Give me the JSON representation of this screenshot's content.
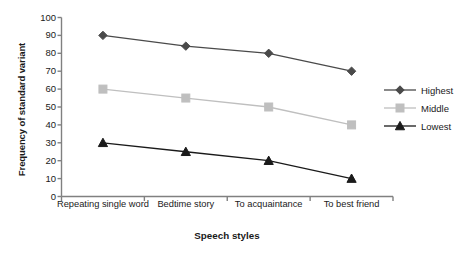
{
  "chart_data": {
    "type": "line",
    "title": "",
    "xlabel": "Speech styles",
    "ylabel": "Frequency of standard variant",
    "categories": [
      "Repeating single word",
      "Bedtime story",
      "To acquaintance",
      "To best friend"
    ],
    "series": [
      {
        "name": "Highest",
        "values": [
          90,
          84,
          80,
          70
        ],
        "marker": "diamond",
        "color": "#4a4a4a"
      },
      {
        "name": "Middle",
        "values": [
          60,
          55,
          50,
          40
        ],
        "marker": "square",
        "color": "#bfbfbf"
      },
      {
        "name": "Lowest",
        "values": [
          30,
          25,
          20,
          10
        ],
        "marker": "triangle",
        "color": "#1a1a1a"
      }
    ],
    "ylim": [
      0,
      100
    ],
    "ytick_step": 10,
    "yticks": [
      100,
      90,
      80,
      70,
      60,
      50,
      40,
      30,
      20,
      10,
      0
    ],
    "grid": false,
    "legend_position": "right"
  },
  "axes": {
    "y_title": "Frequency of standard variant",
    "x_title": "Speech styles"
  },
  "legend": {
    "entries": [
      {
        "label": "Highest"
      },
      {
        "label": "Middle"
      },
      {
        "label": "Lowest"
      }
    ]
  },
  "colors": {
    "highest": "#4a4a4a",
    "middle": "#bfbfbf",
    "lowest": "#1a1a1a",
    "axis": "#808080",
    "background": "#ffffff"
  }
}
